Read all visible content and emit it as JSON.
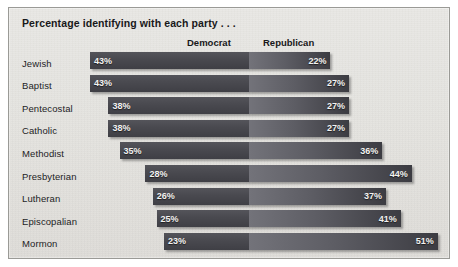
{
  "title": "Percentage identifying with each party . . .",
  "columns": {
    "democrat": "Democrat",
    "republican": "Republican"
  },
  "chart_data": {
    "type": "bar",
    "subtype": "diverging-horizontal-bar",
    "title": "Percentage identifying with each party . . .",
    "xlabel": "",
    "ylabel": "",
    "categories": [
      "Jewish",
      "Baptist",
      "Pentecostal",
      "Catholic",
      "Methodist",
      "Presbyterian",
      "Lutheran",
      "Episcopalian",
      "Mormon"
    ],
    "series": [
      {
        "name": "Democrat",
        "side": "left",
        "color": "#4a4a50",
        "values": [
          43,
          43,
          38,
          38,
          35,
          28,
          26,
          25,
          23
        ],
        "labels": [
          "43%",
          "43%",
          "38%",
          "38%",
          "35%",
          "28%",
          "26%",
          "25%",
          "23%"
        ]
      },
      {
        "name": "Republican",
        "side": "right",
        "color": "#5d5d64",
        "values": [
          22,
          27,
          27,
          27,
          36,
          44,
          37,
          41,
          51
        ],
        "labels": [
          "22%",
          "27%",
          "27%",
          "27%",
          "36%",
          "44%",
          "37%",
          "41%",
          "51%"
        ]
      }
    ],
    "units": "percent",
    "grid": false,
    "legend": "top",
    "axis_center": 0,
    "xlim": [
      -45,
      55
    ]
  }
}
